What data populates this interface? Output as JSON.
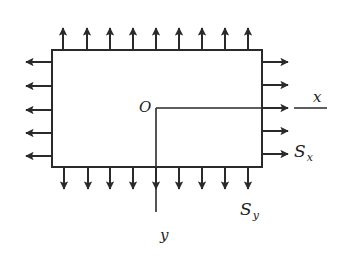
{
  "diagram": {
    "title": "",
    "colors": {
      "stroke": "#2a2a2a",
      "background": "#ffffff"
    },
    "plate": {
      "x": 52,
      "y": 50,
      "width": 210,
      "height": 117
    },
    "origin": {
      "label": "O",
      "x": 156,
      "y": 108
    },
    "axes": {
      "x": {
        "label": "x",
        "end_x": 327
      },
      "y": {
        "label": "y",
        "end_y": 212
      }
    },
    "stress_labels": {
      "sx": {
        "main": "S",
        "sub": "x"
      },
      "sy": {
        "main": "S",
        "sub": "y"
      }
    },
    "arrows": {
      "top_x": [
        63,
        87,
        110,
        133,
        156,
        179,
        202,
        225,
        248
      ],
      "bottom_x": [
        64,
        88,
        110,
        133,
        156,
        179,
        202,
        225,
        248
      ],
      "left_y": [
        62,
        86,
        110,
        133,
        156
      ],
      "right_y": [
        62,
        85,
        108,
        131,
        154
      ],
      "length": 22
    }
  }
}
